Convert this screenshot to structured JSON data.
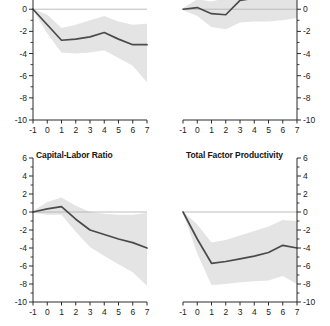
{
  "figure": {
    "background": "#ffffff",
    "line_color": "#4a4a4a",
    "band_color": "#e4e4e4",
    "axis_color": "#2b2b2b",
    "zero_line_color": "#b4b4b4"
  },
  "panels": [
    {
      "id": "top-left",
      "title": "",
      "title_visible": false,
      "y_axis_side": "left"
    },
    {
      "id": "top-right",
      "title": "",
      "title_visible": false,
      "y_axis_side": "right"
    },
    {
      "id": "bottom-left",
      "title": "Capital-Labor Ratio",
      "title_visible": true,
      "y_axis_side": "left"
    },
    {
      "id": "bottom-right",
      "title": "Total Factor Productivity",
      "title_visible": true,
      "y_axis_side": "right"
    }
  ],
  "chart_data": [
    {
      "panel": "top-left",
      "type": "line",
      "title": "",
      "xlabel": "",
      "ylabel": "",
      "xlim": [
        -1,
        7
      ],
      "ylim": [
        -10,
        3
      ],
      "y_ticks": [
        2,
        0,
        -2,
        -4,
        -6,
        -8,
        -10
      ],
      "y_minor_ticks": [
        3,
        1,
        -1,
        -3,
        -5,
        -7,
        -9
      ],
      "x_ticks": [
        -1,
        0,
        1,
        2,
        3,
        4,
        5,
        6,
        7
      ],
      "grid": false,
      "legend": "none",
      "zero_line": true,
      "x": [
        -1,
        0,
        1,
        2,
        3,
        4,
        5,
        6,
        7
      ],
      "series": [
        {
          "name": "impulse response",
          "values": [
            0.0,
            -1.4,
            -2.8,
            -2.7,
            -2.5,
            -2.1,
            -2.7,
            -3.2,
            -3.2
          ]
        },
        {
          "name": "band upper",
          "values": [
            0.05,
            -0.5,
            -1.7,
            -1.4,
            -1.0,
            -0.6,
            -1.1,
            -1.4,
            -1.3
          ]
        },
        {
          "name": "band lower",
          "values": [
            -0.05,
            -2.2,
            -3.9,
            -4.0,
            -3.9,
            -3.7,
            -4.4,
            -5.1,
            -6.6
          ]
        }
      ]
    },
    {
      "panel": "top-right",
      "type": "line",
      "title": "",
      "xlabel": "",
      "ylabel": "",
      "xlim": [
        -1,
        7
      ],
      "ylim": [
        -10,
        3
      ],
      "y_ticks": [
        2,
        0,
        -2,
        -4,
        -6,
        -8,
        -10
      ],
      "y_minor_ticks": [
        3,
        1,
        -1,
        -3,
        -5,
        -7,
        -9
      ],
      "x_ticks": [
        -1,
        0,
        1,
        2,
        3,
        4,
        5,
        6,
        7
      ],
      "grid": false,
      "legend": "none",
      "zero_line": true,
      "x": [
        -1,
        0,
        1,
        2,
        3,
        4,
        5,
        6,
        7
      ],
      "series": [
        {
          "name": "impulse response",
          "values": [
            0.0,
            0.15,
            -0.4,
            -0.5,
            0.8,
            1.0,
            1.4,
            1.6,
            2.2
          ]
        },
        {
          "name": "band upper",
          "values": [
            0.1,
            0.9,
            0.7,
            1.0,
            2.3,
            2.6,
            3.0,
            3.0,
            3.2
          ]
        },
        {
          "name": "band lower",
          "values": [
            -0.1,
            -0.6,
            -1.6,
            -1.8,
            -1.2,
            -1.1,
            -1.1,
            -1.0,
            -0.8
          ]
        }
      ]
    },
    {
      "panel": "bottom-left",
      "type": "line",
      "title": "Capital-Labor Ratio",
      "xlabel": "",
      "ylabel": "",
      "xlim": [
        -1,
        7
      ],
      "ylim": [
        -10,
        6
      ],
      "y_ticks": [
        6,
        4,
        2,
        0,
        -2,
        -4,
        -6,
        -8,
        -10
      ],
      "y_minor_ticks": [
        5,
        3,
        1,
        -1,
        -3,
        -5,
        -7,
        -9
      ],
      "x_ticks": [
        -1,
        0,
        1,
        2,
        3,
        4,
        5,
        6,
        7
      ],
      "grid": false,
      "legend": "none",
      "zero_line": true,
      "x": [
        -1,
        0,
        1,
        2,
        3,
        4,
        5,
        6,
        7
      ],
      "series": [
        {
          "name": "impulse response",
          "values": [
            0.0,
            0.35,
            0.6,
            -0.8,
            -2.0,
            -2.5,
            -3.0,
            -3.4,
            -4.0
          ]
        },
        {
          "name": "band upper",
          "values": [
            0.1,
            1.1,
            1.6,
            0.7,
            0.0,
            -0.2,
            -0.3,
            -0.3,
            -0.1
          ]
        },
        {
          "name": "band lower",
          "values": [
            -0.1,
            -0.3,
            -0.3,
            -2.2,
            -3.9,
            -4.9,
            -5.8,
            -6.7,
            -8.2
          ]
        }
      ]
    },
    {
      "panel": "bottom-right",
      "type": "line",
      "title": "Total Factor Productivity",
      "xlabel": "",
      "ylabel": "",
      "xlim": [
        -1,
        7
      ],
      "ylim": [
        -10,
        6
      ],
      "y_ticks": [
        6,
        4,
        2,
        0,
        -2,
        -4,
        -6,
        -8,
        -10
      ],
      "y_minor_ticks": [
        5,
        3,
        1,
        -1,
        -3,
        -5,
        -7,
        -9
      ],
      "x_ticks": [
        -1,
        0,
        1,
        2,
        3,
        4,
        5,
        6,
        7
      ],
      "grid": false,
      "legend": "none",
      "zero_line": true,
      "x": [
        -1,
        0,
        1,
        2,
        3,
        4,
        5,
        6,
        7
      ],
      "series": [
        {
          "name": "impulse response",
          "values": [
            0.0,
            -3.0,
            -5.7,
            -5.5,
            -5.2,
            -4.9,
            -4.5,
            -3.7,
            -4.0
          ]
        },
        {
          "name": "band upper",
          "values": [
            0.05,
            -1.4,
            -3.4,
            -3.1,
            -2.6,
            -2.1,
            -1.6,
            -0.9,
            -1.0
          ]
        },
        {
          "name": "band lower",
          "values": [
            -0.05,
            -4.6,
            -8.1,
            -8.0,
            -7.8,
            -7.7,
            -7.6,
            -7.1,
            -8.0
          ]
        }
      ]
    }
  ]
}
